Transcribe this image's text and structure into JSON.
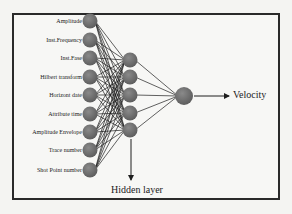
{
  "diagram": {
    "type": "neural-network",
    "input_layer": {
      "labels": [
        "Amplitude",
        "Inst.Frequency",
        "Inst.Fase",
        "Hilbert transform",
        "Horizont date",
        "Attribute time",
        "Amplitude Envelope",
        "Trace number",
        "Shot Point number"
      ],
      "node_y": [
        21,
        40,
        58,
        77,
        95,
        114,
        132,
        150,
        170
      ],
      "node_x": 90
    },
    "hidden_layer": {
      "label": "Hidden layer",
      "node_count": 5,
      "node_y": [
        60,
        77,
        95,
        113,
        130
      ],
      "node_x": 130
    },
    "output_layer": {
      "label": "Velocity",
      "node_x": 184,
      "node_y": 96
    },
    "colors": {
      "node_fill": "#6f6f6f",
      "edge": "#1e1e1e",
      "border": "#2a2a2a",
      "background": "#f7f7f5"
    }
  }
}
